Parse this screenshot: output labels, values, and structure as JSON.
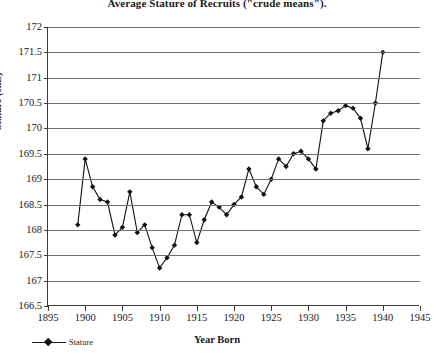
{
  "chart_data": {
    "type": "line",
    "title": "Average Stature of Recruits (\"crude means\").",
    "xlabel": "Year Born",
    "ylabel": "Stature (cms)",
    "xlim": [
      1895,
      1945
    ],
    "ylim": [
      166.5,
      172
    ],
    "xticks": [
      1895,
      1900,
      1905,
      1910,
      1915,
      1920,
      1925,
      1930,
      1935,
      1940,
      1945
    ],
    "yticks": [
      166.5,
      167,
      167.5,
      168,
      168.5,
      169,
      169.5,
      170,
      170.5,
      171,
      171.5,
      172
    ],
    "ytick_labels": [
      "166.5",
      "167",
      "167.5",
      "168",
      "168.5",
      "169",
      "169.5",
      "170",
      "170.5",
      "171",
      "171.5",
      "172"
    ],
    "xtick_labels": [
      "1895",
      "1900",
      "1905",
      "1910",
      "1915",
      "1920",
      "1925",
      "1930",
      "1935",
      "1940",
      "1945"
    ],
    "grid": "horizontal",
    "legend_position": "bottom-left",
    "legend": [
      "Stature"
    ],
    "marker": "diamond",
    "line_color": "#111111",
    "grid_color": "#6f6f6f",
    "axis_color": "#3a3a3a",
    "series": [
      {
        "name": "Stature",
        "x": [
          1899,
          1900,
          1901,
          1902,
          1903,
          1904,
          1905,
          1906,
          1907,
          1908,
          1909,
          1910,
          1911,
          1912,
          1913,
          1914,
          1915,
          1916,
          1917,
          1918,
          1919,
          1920,
          1921,
          1922,
          1923,
          1924,
          1925,
          1926,
          1927,
          1928,
          1929,
          1930,
          1931,
          1932,
          1933,
          1934,
          1935,
          1936,
          1937,
          1938,
          1939,
          1940
        ],
        "values": [
          168.1,
          169.4,
          168.85,
          168.6,
          168.55,
          167.9,
          168.05,
          168.75,
          167.95,
          168.1,
          167.65,
          167.25,
          167.45,
          167.7,
          168.3,
          168.3,
          167.75,
          168.2,
          168.55,
          168.45,
          168.3,
          168.5,
          168.65,
          169.2,
          168.85,
          168.7,
          169.0,
          169.4,
          169.25,
          169.5,
          169.55,
          169.4,
          169.2,
          170.15,
          170.3,
          170.35,
          170.45,
          170.4,
          170.2,
          169.6,
          170.5,
          171.5
        ]
      }
    ]
  }
}
